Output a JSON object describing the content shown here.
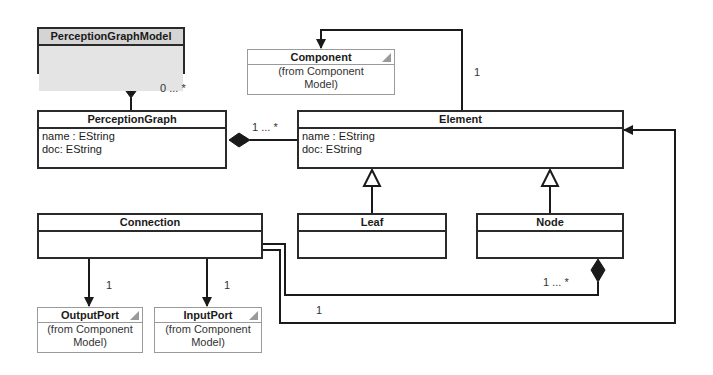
{
  "classes": {
    "perception_graph_model": {
      "name": "PerceptionGraphModel",
      "attributes": []
    },
    "perception_graph": {
      "name": "PerceptionGraph",
      "attributes": [
        "name : EString",
        "doc: EString"
      ]
    },
    "element": {
      "name": "Element",
      "attributes": [
        "name : EString",
        "doc: EString"
      ]
    },
    "leaf": {
      "name": "Leaf",
      "attributes": []
    },
    "node": {
      "name": "Node",
      "attributes": []
    },
    "connection": {
      "name": "Connection",
      "attributes": []
    },
    "component": {
      "name": "Component",
      "from": "(from Component Model)",
      "from_line1": "(from Component",
      "from_line2": "Model)"
    },
    "output_port": {
      "name": "OutputPort",
      "from_line1": "(from Component",
      "from_line2": "Model)"
    },
    "input_port": {
      "name": "InputPort",
      "from_line1": "(from Component",
      "from_line2": "Model)"
    }
  },
  "multiplicities": {
    "model_to_graph": "0 ... *",
    "graph_to_element": "1 ... *",
    "element_to_component": "1",
    "connection_to_output": "1",
    "connection_to_input": "1",
    "node_to_connection": "1 ... *",
    "connection_to_element": "1"
  }
}
